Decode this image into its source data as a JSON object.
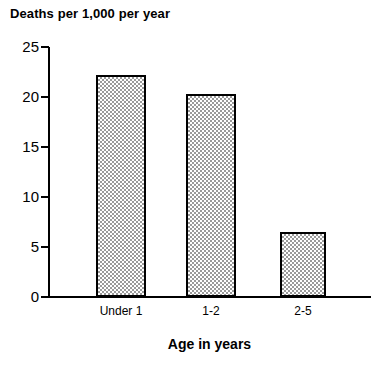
{
  "chart_data": {
    "type": "bar",
    "title": "Deaths per 1,000 per year",
    "xlabel": "Age in years",
    "ylabel": "",
    "categories": [
      "Under 1",
      "1-2",
      "2-5"
    ],
    "values": [
      22.2,
      20.3,
      6.5
    ],
    "ylim": [
      0,
      25
    ],
    "yticks": [
      0,
      5,
      10,
      15,
      20,
      25
    ],
    "ytick_labels": [
      "0",
      "5",
      "10",
      "15",
      "20",
      "25"
    ],
    "grid": false,
    "legend": null,
    "bar_fill": "#9a9a9a",
    "bar_fill_style": "checkerboard-dither",
    "bar_edge_color": "#000000",
    "axis_color": "#000000",
    "background": "#ffffff"
  },
  "bars": [
    {
      "label": "Under 1",
      "value": 22.2,
      "left": 96,
      "width": 50
    },
    {
      "label": "1-2",
      "value": 20.3,
      "left": 186,
      "width": 50
    },
    {
      "label": "2-5",
      "value": 6.5,
      "left": 280,
      "width": 46
    }
  ],
  "yticks": [
    {
      "label": "25",
      "value": 25
    },
    {
      "label": "20",
      "value": 20
    },
    {
      "label": "15",
      "value": 15
    },
    {
      "label": "10",
      "value": 10
    },
    {
      "label": "5",
      "value": 5
    },
    {
      "label": "0",
      "value": 0
    }
  ]
}
